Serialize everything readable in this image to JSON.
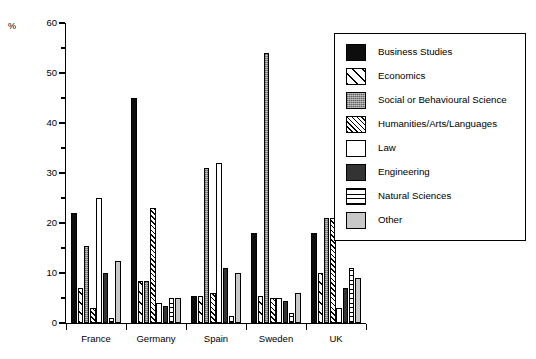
{
  "chart_data": {
    "type": "bar",
    "title": "",
    "subtitle": "",
    "xlabel": "",
    "ylabel": "%",
    "ylim": [
      0,
      60
    ],
    "ytick_labels": [
      "0",
      "10",
      "20",
      "30",
      "40",
      "50",
      "60"
    ],
    "ytick_values": [
      0,
      10,
      20,
      30,
      40,
      50,
      60
    ],
    "minor_ytick_values": [
      5,
      15,
      25,
      35,
      45,
      55
    ],
    "grid": false,
    "legend_position": "right",
    "categories": [
      "France",
      "Germany",
      "Spain",
      "Sweden",
      "UK"
    ],
    "series": [
      {
        "name": "Business Studies",
        "pattern": "solid-black",
        "color": "#0d0d0d",
        "values": [
          22,
          45,
          5.5,
          18,
          18
        ]
      },
      {
        "name": "Economics",
        "pattern": "diagonal-line",
        "color": "#ffffff",
        "values": [
          7,
          8.5,
          5.5,
          5.5,
          10
        ]
      },
      {
        "name": "Social or Behavioural Science",
        "pattern": "gray-stipple",
        "color": "#8e8e8e",
        "values": [
          15.5,
          8.5,
          31,
          54,
          21
        ]
      },
      {
        "name": "Humanities/Arts/Languages",
        "pattern": "diagonal-hatch",
        "color": "#ffffff",
        "values": [
          3,
          23,
          6,
          5,
          21
        ]
      },
      {
        "name": "Law",
        "pattern": "white",
        "color": "#ffffff",
        "values": [
          25,
          4,
          32,
          5,
          3
        ]
      },
      {
        "name": "Engineering",
        "pattern": "solid-dark-gray",
        "color": "#333333",
        "values": [
          10,
          3.5,
          11,
          4.5,
          7
        ]
      },
      {
        "name": "Natural Sciences",
        "pattern": "horizontal-lines",
        "color": "#ffffff",
        "values": [
          1,
          5,
          1.5,
          2,
          11
        ]
      },
      {
        "name": "Other",
        "pattern": "light-gray",
        "color": "#c8c8c8",
        "values": [
          12.5,
          5,
          10,
          6,
          9
        ]
      }
    ]
  },
  "axis": {
    "unit_label": "%"
  }
}
